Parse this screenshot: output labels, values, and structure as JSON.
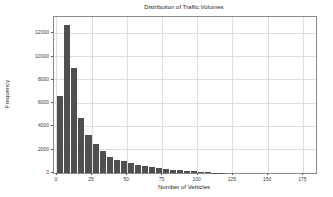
{
  "chart_data": {
    "type": "bar",
    "subtype": "histogram",
    "title": "Distribution of Traffic Volumes",
    "xlabel": "Number of Vehicles",
    "ylabel": "Frequency",
    "bin_width": 5,
    "bin_starts": [
      0,
      5,
      10,
      15,
      20,
      25,
      30,
      35,
      40,
      45,
      50,
      55,
      60,
      65,
      70,
      75,
      80,
      85,
      90,
      95,
      100,
      105,
      110,
      115
    ],
    "values": [
      6600,
      12700,
      9000,
      4700,
      3250,
      2500,
      1850,
      1400,
      1100,
      1000,
      850,
      700,
      600,
      520,
      450,
      380,
      300,
      240,
      190,
      140,
      90,
      50,
      25,
      10
    ],
    "x_ticks": [
      0,
      25,
      50,
      75,
      100,
      125,
      150,
      175
    ],
    "y_ticks": [
      0,
      2000,
      4000,
      6000,
      8000,
      10000,
      12000
    ],
    "xlim": [
      -2,
      184
    ],
    "ylim": [
      0,
      13400
    ],
    "grid": true,
    "legend": "none",
    "bar_color": "#4f4f4f",
    "grid_color": "#dedede",
    "spine_color": "#8a8a8a",
    "text_color": "#3a3a3a",
    "background_color": "#ffffff"
  }
}
